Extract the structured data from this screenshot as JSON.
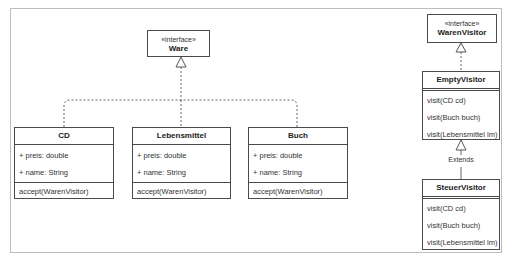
{
  "diagram": {
    "type": "UML class diagram",
    "interfaces": [
      {
        "stereotype": "«interface»",
        "name": "Ware"
      },
      {
        "stereotype": "«interface»",
        "name": "WarenVisitor"
      }
    ],
    "classes": [
      {
        "name": "CD",
        "attributes": [
          "+ preis: double",
          "+ name: String"
        ],
        "methods": [
          "accept(WarenVisitor)"
        ]
      },
      {
        "name": "Lebensmittel",
        "attributes": [
          "+ preis: double",
          "+ name: String"
        ],
        "methods": [
          "accept(WarenVisitor)"
        ]
      },
      {
        "name": "Buch",
        "attributes": [
          "+ preis: double",
          "+ name: String"
        ],
        "methods": [
          "accept(WarenVisitor)"
        ]
      },
      {
        "name": "EmptyVisitor",
        "methods": [
          "visit(CD cd)",
          "visit(Buch buch)",
          "visit(Lebensmittel lm)"
        ]
      },
      {
        "name": "SteuerVisitor",
        "methods": [
          "visit(CD cd)",
          "visit(Buch buch)",
          "visit(Lebensmittel lm)"
        ]
      }
    ],
    "relations": [
      {
        "from": "CD",
        "to": "Ware",
        "kind": "realization"
      },
      {
        "from": "Lebensmittel",
        "to": "Ware",
        "kind": "realization"
      },
      {
        "from": "Buch",
        "to": "Ware",
        "kind": "realization"
      },
      {
        "from": "EmptyVisitor",
        "to": "WarenVisitor",
        "kind": "realization"
      },
      {
        "from": "SteuerVisitor",
        "to": "EmptyVisitor",
        "kind": "generalization",
        "label": "Extends"
      }
    ]
  }
}
